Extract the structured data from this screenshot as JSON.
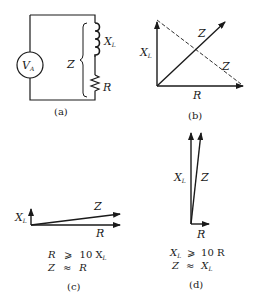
{
  "panels": {
    "a": {
      "caption": "(a)",
      "source_label": "V",
      "source_sub": "A",
      "inductor_label": "X",
      "inductor_sub": "L",
      "impedance_label": "Z",
      "resistor_label": "R"
    },
    "b": {
      "caption": "(b)",
      "xl_label": "X",
      "xl_sub": "L",
      "z_label": "Z",
      "z_dashed_label": "Z",
      "r_label": "R"
    },
    "c": {
      "caption": "(c)",
      "xl_label": "X",
      "xl_sub": "L",
      "z_label": "Z",
      "r_label": "R",
      "eq1_left": "R",
      "eq1_op": "⩾",
      "eq1_right": "10 X",
      "eq1_right_sub": "L",
      "eq2_left": "Z",
      "eq2_op": "≈",
      "eq2_right": "R"
    },
    "d": {
      "caption": "(d)",
      "xl_label": "X",
      "xl_sub": "L",
      "z_label": "Z",
      "r_label": "R",
      "eq1_left": "X",
      "eq1_left_sub": "L",
      "eq1_op": "⩾",
      "eq1_right": "10 R",
      "eq2_left": "Z",
      "eq2_op": "≈",
      "eq2_right": "X",
      "eq2_right_sub": "L"
    }
  }
}
